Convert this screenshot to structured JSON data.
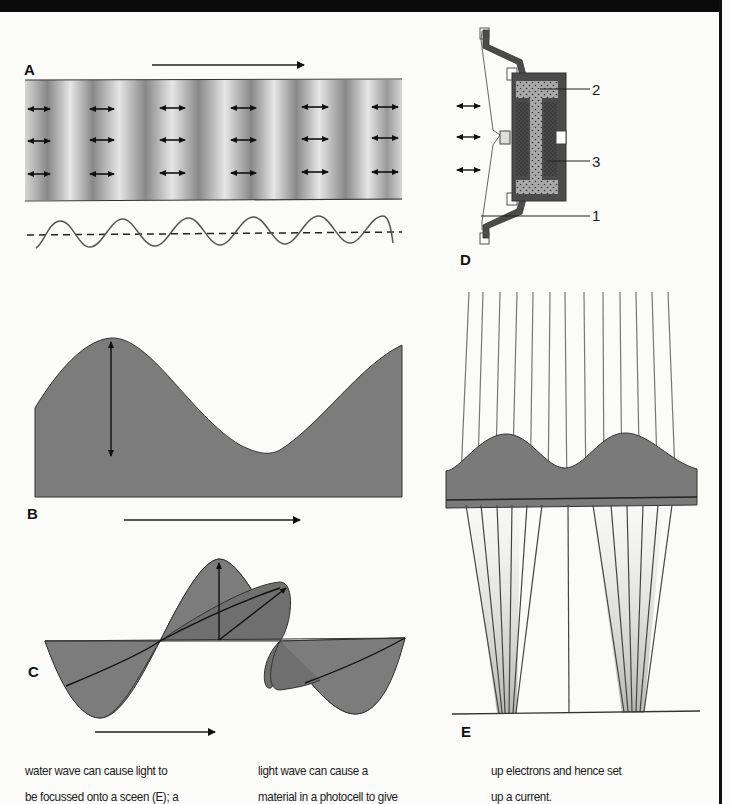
{
  "figure": {
    "panels": [
      {
        "id": "A",
        "label": "A",
        "description": "longitudinal sound wave compressions and rarefactions with particle oscillation arrows and sine representation"
      },
      {
        "id": "B",
        "label": "B",
        "description": "transverse water wave profile with amplitude arrow"
      },
      {
        "id": "C",
        "label": "C",
        "description": "polarized electromagnetic wave with perpendicular field components"
      },
      {
        "id": "D",
        "label": "D",
        "description": "loudspeaker / microphone cross-section",
        "callouts": [
          "2",
          "3",
          "1"
        ]
      },
      {
        "id": "E",
        "label": "E",
        "description": "water wave lens focusing light rays onto a screen"
      }
    ],
    "colors": {
      "fill_gray": "#7b7b7b",
      "dark_gray": "#4a4a4a",
      "band_light": "#e4e4e4",
      "band_dark": "#858585",
      "line": "#222222"
    }
  },
  "caption": {
    "columns": [
      {
        "lines": [
          "water wave can cause light to",
          "be focussed onto a sceen (E); a"
        ]
      },
      {
        "lines": [
          "light wave can cause a",
          "material in a photocell to give"
        ]
      },
      {
        "lines": [
          "up electrons and hence set",
          "up a current."
        ]
      }
    ]
  }
}
